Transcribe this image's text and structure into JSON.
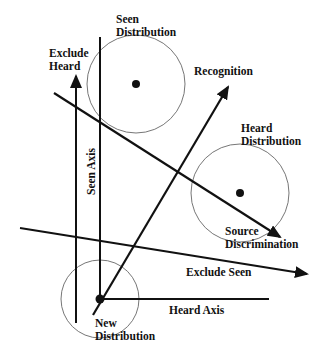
{
  "diagram": {
    "type": "signal-detection vector diagram",
    "colors": {
      "ink": "#111111",
      "circle": "#666666",
      "background": "#ffffff"
    },
    "labels": {
      "seen_distribution": [
        "Seen",
        "Distribution"
      ],
      "exclude_heard": [
        "Exclude",
        "Heard"
      ],
      "recognition": "Recognition",
      "heard_distribution": [
        "Heard",
        "Distribution"
      ],
      "seen_axis": "Seen Axis",
      "source_discrimination": [
        "Source",
        "Discrimination"
      ],
      "exclude_seen": "Exclude Seen",
      "heard_axis": "Heard Axis",
      "new_distribution": [
        "New",
        "Distribution"
      ]
    },
    "distributions": [
      {
        "name": "Seen Distribution",
        "cx": 136,
        "cy": 84,
        "r": 49
      },
      {
        "name": "Heard Distribution",
        "cx": 240,
        "cy": 193,
        "r": 49
      },
      {
        "name": "New Distribution",
        "cx": 100,
        "cy": 299,
        "r": 39
      }
    ]
  }
}
